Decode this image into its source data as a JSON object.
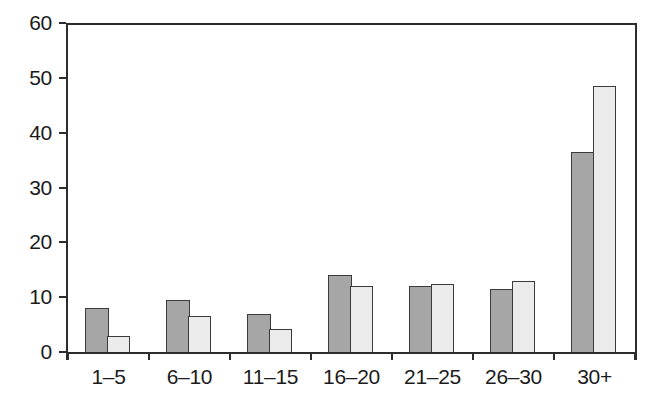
{
  "chart_data": {
    "type": "bar",
    "title": "",
    "xlabel": "",
    "ylabel": "",
    "categories": [
      "1–5",
      "6–10",
      "11–15",
      "16–20",
      "21–25",
      "26–30",
      "30+"
    ],
    "series": [
      {
        "name": "dark-gray-bars",
        "color": "#a6a6a6",
        "values": [
          8,
          9.4,
          7,
          14,
          12,
          11.4,
          36.5
        ]
      },
      {
        "name": "light-gray-bars",
        "color": "#ebebeb",
        "values": [
          3,
          6.6,
          4.2,
          12,
          12.4,
          13,
          48.5
        ]
      }
    ],
    "ylim": [
      0,
      60
    ],
    "yticks": [
      0,
      10,
      20,
      30,
      40,
      50,
      60
    ],
    "ytick_labels": [
      "0",
      "10",
      "20",
      "30",
      "40",
      "50",
      "60"
    ],
    "grid": false,
    "legend": "none",
    "bar_border_color": "#3b3b3b",
    "axis_color": "#2d2d2d",
    "text_color": "#1b1b1b",
    "background_color": "#ffffff"
  }
}
